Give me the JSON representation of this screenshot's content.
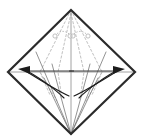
{
  "figure": {
    "caption": "Square paper rotated 45 degrees showing existing creases and two outward fold arrows",
    "width": 143,
    "height": 140,
    "background_color": "#ffffff"
  },
  "colors": {
    "outline": "#2b2b2b",
    "crease_solid": "#6f6f6f",
    "crease_dashed": "#b9b9b9",
    "center_line": "#8a8a8a",
    "arrow": "#1c1c1c",
    "pinch_mark": "#b0b0b0",
    "background": "#ffffff"
  },
  "geometry": {
    "vertices": {
      "top": {
        "x": 71,
        "y": 10,
        "label": "top-vertex"
      },
      "left": {
        "x": 8,
        "y": 72,
        "label": "left-vertex"
      },
      "right": {
        "x": 135,
        "y": 72,
        "label": "right-vertex"
      },
      "bottom": {
        "x": 71,
        "y": 134,
        "label": "bottom-vertex"
      }
    },
    "outline_path": "M71,10 L135,72 L71,134 L8,72 Z",
    "outline_width": 2.2,
    "center_horizontal": {
      "x1": 8,
      "y1": 72,
      "x2": 135,
      "y2": 72
    },
    "center_vertical": {
      "x1": 71,
      "y1": 10,
      "x2": 71,
      "y2": 134
    }
  },
  "creases": {
    "dashed": [
      {
        "name": "dashed-crease-left-outer",
        "d": "M71,10 L40,72 L57,101"
      },
      {
        "name": "dashed-crease-right-outer",
        "d": "M71,10 L102,72 L86,101"
      },
      {
        "name": "dashed-crease-left-inner",
        "d": "M71,13 L58,72 L62,99"
      },
      {
        "name": "dashed-crease-right-inner",
        "d": "M71,13 L84,72 L80,99"
      },
      {
        "name": "dashed-crease-left-low",
        "d": "M40,72 L50,95"
      },
      {
        "name": "dashed-crease-right-low",
        "d": "M102,72 L92,95"
      }
    ],
    "dash_pattern": "2.2 2.2",
    "solid": [
      {
        "name": "solid-crease-left-long",
        "d": "M71,134 L36,52"
      },
      {
        "name": "solid-crease-right-long",
        "d": "M71,134 L106,52"
      },
      {
        "name": "solid-crease-left-short",
        "d": "M71,134 L52,64"
      },
      {
        "name": "solid-crease-right-short",
        "d": "M71,134 L90,64"
      },
      {
        "name": "solid-crease-left-mid",
        "d": "M71,134 L44,78"
      },
      {
        "name": "solid-crease-right-mid",
        "d": "M71,134 L98,78"
      }
    ]
  },
  "arrows": {
    "left": {
      "name": "fold-arrow-left",
      "direction": "left",
      "curve_top": "M69,96 C60,92 40,80 24,70",
      "curve_bottom": "M64,98 C56,90 38,76 23,69",
      "shaft": "M74,71 L27,71",
      "head": {
        "points": "30,66 18,69 30,74",
        "tip_x": 18,
        "tip_y": 69
      }
    },
    "right": {
      "name": "fold-arrow-right",
      "direction": "right",
      "curve_top": "M74,96 C83,92 103,80 119,70",
      "curve_bottom": "M79,98 C87,90 105,76 120,69",
      "shaft": "M69,71 L116,71",
      "head": {
        "points": "113,66 125,69 113,74",
        "tip_x": 125,
        "tip_y": 69
      }
    }
  },
  "pinch_marks": {
    "description": "Small dotted curved arrows with rounded ends near the apex indicating a pinch fold",
    "left": {
      "name": "pinch-arrow-left",
      "arc": "M55,36 C59,30 66,30 70,35",
      "start_dot": {
        "cx": 55,
        "cy": 36,
        "r": 2.1
      },
      "end_dot": {
        "cx": 70,
        "cy": 36,
        "r": 2.1
      }
    },
    "right": {
      "name": "pinch-arrow-right",
      "arc": "M88,36 C84,30 77,30 73,35",
      "start_dot": {
        "cx": 88,
        "cy": 36,
        "r": 2.1
      },
      "end_dot": {
        "cx": 73,
        "cy": 36,
        "r": 2.1
      }
    },
    "connector": {
      "x1": 70,
      "y1": 36,
      "x2": 73,
      "y2": 36
    },
    "dash_pattern": "1.4 1.6"
  }
}
